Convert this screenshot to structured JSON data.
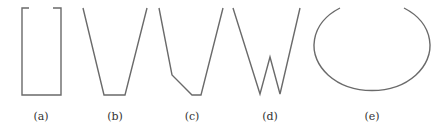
{
  "figure": {
    "panels": [
      {
        "id": "a",
        "label": "(a)",
        "shape": "open rectangle (bracket-like, gaps in top edge)"
      },
      {
        "id": "b",
        "label": "(b)",
        "shape": "open trapezoid (V with flat bottom)"
      },
      {
        "id": "c",
        "label": "(c)",
        "shape": "asymmetric open polygon with kinked left side"
      },
      {
        "id": "d",
        "label": "(d)",
        "shape": "W shape"
      },
      {
        "id": "e",
        "label": "(e)",
        "shape": "open ellipse (gap at top)"
      }
    ],
    "stroke_color": "#6a6a6a",
    "label_color": "#333333",
    "background": "#ffffff"
  }
}
